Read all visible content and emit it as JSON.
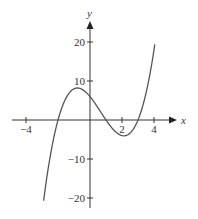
{
  "chart_data": {
    "type": "line",
    "title": "",
    "xlabel": "x",
    "ylabel": "y",
    "xlim": [
      -5,
      5.5
    ],
    "ylim": [
      -22,
      24
    ],
    "grid": false,
    "legend": null,
    "x_ticks": [
      -4,
      2,
      4
    ],
    "x_tick_labels": [
      "−4",
      "2",
      "4"
    ],
    "y_ticks": [
      20,
      10,
      -10,
      -20
    ],
    "y_tick_labels": [
      "20",
      "10",
      "−10",
      "−20"
    ],
    "series": [
      {
        "name": "f(x)",
        "description": "cubic with roots at -2, 1, 3; local max near (-0.8, 8.2), local min near (2.1, -4.1)",
        "x": [
          -2.9,
          -2.5,
          -2,
          -1.5,
          -1,
          -0.8,
          -0.5,
          0,
          0.5,
          1,
          1.5,
          2,
          2.1,
          2.5,
          3,
          3.5,
          4,
          4.05
        ],
        "y": [
          -20.7,
          -9.6,
          0,
          5.6,
          8.0,
          8.2,
          7.9,
          6.0,
          3.1,
          0,
          -2.6,
          -4.0,
          -4.1,
          -3.4,
          0,
          6.9,
          18.0,
          19.3
        ]
      }
    ],
    "colors": {
      "curve": "#555555",
      "axis": "#333333"
    }
  }
}
